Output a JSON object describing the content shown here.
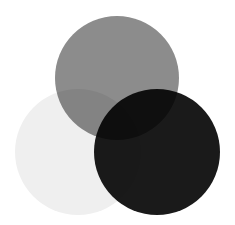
{
  "figure": {
    "background_color": "#ffffff",
    "width": 235,
    "height": 225,
    "blend_mode": "multiply"
  },
  "chart_data": {
    "type": "venn",
    "title": "",
    "xlabel": "",
    "ylabel": "",
    "legend_position": "none",
    "grid": false,
    "background_color": "#ffffff",
    "blend_mode": "multiply",
    "set_count": 3,
    "sets": [
      {
        "id": "top",
        "label": "",
        "cx": 117,
        "cy": 78,
        "r": 62,
        "fill": "#8c8c8c",
        "tone": "medium-gray"
      },
      {
        "id": "left",
        "label": "",
        "cx": 78,
        "cy": 152,
        "r": 63,
        "fill": "#efefef",
        "tone": "near-white"
      },
      {
        "id": "right",
        "label": "",
        "cx": 157,
        "cy": 152,
        "r": 63,
        "fill": "#1a1a1a",
        "tone": "near-black"
      }
    ],
    "regions": [
      {
        "id": "top-only",
        "members": [
          "top"
        ],
        "fill": "#8c8c8c"
      },
      {
        "id": "left-only",
        "members": [
          "left"
        ],
        "fill": "#efefef"
      },
      {
        "id": "right-only",
        "members": [
          "right"
        ],
        "fill": "#1a1a1a"
      },
      {
        "id": "top-left",
        "members": [
          "top",
          "left"
        ],
        "fill": "#6e6e6e"
      },
      {
        "id": "top-right",
        "members": [
          "top",
          "right"
        ],
        "fill": "#3c3c3c"
      },
      {
        "id": "left-right",
        "members": [
          "left",
          "right"
        ],
        "fill": "#242424"
      },
      {
        "id": "top-left-right",
        "members": [
          "top",
          "left",
          "right"
        ],
        "fill": "#0d0d0d"
      }
    ]
  }
}
